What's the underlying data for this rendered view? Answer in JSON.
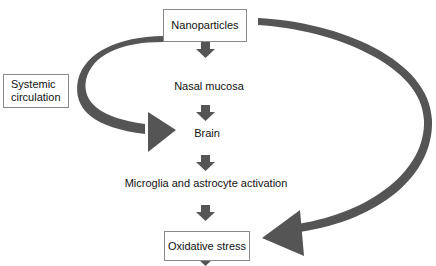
{
  "diagram": {
    "nodes": {
      "nanoparticles": "Nanoparticles",
      "systemic_line1": "Systemic",
      "systemic_line2": "circulation",
      "nasal_mucosa": "Nasal mucosa",
      "brain": "Brain",
      "microglia": "Microglia and astrocyte activation",
      "oxidative_stress": "Oxidative stress"
    },
    "edges": [
      {
        "from": "Nanoparticles",
        "to": "Nasal mucosa",
        "style": "short-down-arrow"
      },
      {
        "from": "Nasal mucosa",
        "to": "Brain",
        "style": "short-down-arrow"
      },
      {
        "from": "Brain",
        "to": "Microglia and astrocyte activation",
        "style": "short-down-arrow"
      },
      {
        "from": "Microglia and astrocyte activation",
        "to": "Oxidative stress",
        "style": "short-down-arrow"
      },
      {
        "from": "Oxidative stress",
        "to": "(continues)",
        "style": "short-down-arrow"
      },
      {
        "from": "Nanoparticles",
        "to": "Brain",
        "style": "curved-left-arrow"
      },
      {
        "from": "Nanoparticles",
        "to": "Oxidative stress",
        "style": "curved-right-arrow"
      }
    ],
    "colors": {
      "arrow": "#555555",
      "box_border": "#8a8a8a",
      "text": "#111111",
      "background": "#ffffff"
    }
  }
}
